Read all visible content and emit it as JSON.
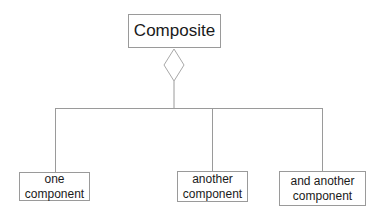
{
  "diagram": {
    "type": "uml-composition",
    "parent": {
      "label": "Composite"
    },
    "relationship": {
      "kind": "aggregation",
      "icon": "hollow-diamond-icon"
    },
    "children": [
      {
        "label_line1": "one",
        "label_line2": "component"
      },
      {
        "label_line1": "another",
        "label_line2": "component"
      },
      {
        "label_line1": "and another",
        "label_line2": "component"
      }
    ],
    "colors": {
      "line": "#9a9a9a",
      "text": "#1a1a1a",
      "background": "#ffffff"
    }
  }
}
